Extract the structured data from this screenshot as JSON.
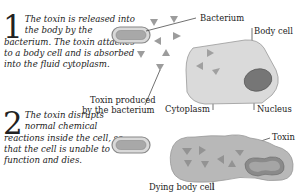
{
  "steps": [
    {
      "number": "1",
      "text": "The toxin is released into the body by the bacterium. The toxin attaches to a body cell and is absorbed into the fluid cytoplasm."
    },
    {
      "number": "2",
      "text": "The toxin disrupts normal chemical reactions inside the cell, so that the cell is unable to function and dies."
    }
  ],
  "labels": {
    "bacterium": "Bacterium",
    "body_cell": "Body cell",
    "toxin_produced_line1": "Toxin produced",
    "toxin_produced_line2": "by the bacterium",
    "cytoplasm": "Cytoplasm",
    "nucleus": "Nucleus",
    "toxin": "Toxin",
    "dying_body_cell": "Dying body cell"
  },
  "colors": {
    "cell_fill": "#d8d8d8",
    "cell_outline": "#9a9a9a",
    "nucleus_fill": "#7a7a7a",
    "toxin_fill": "#9c9c9c",
    "dying_cell_fill": "#b8b8b8"
  }
}
